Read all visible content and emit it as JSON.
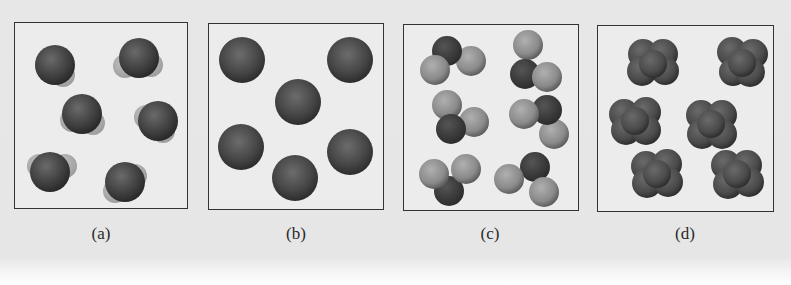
{
  "figure": {
    "panels": [
      {
        "id": "a",
        "label": "(a)",
        "description": "Six bent triatomic molecules (central atom with two faint small atoms)",
        "molecules": 6
      },
      {
        "id": "b",
        "label": "(b)",
        "description": "Six single atoms (monatomic)",
        "molecules": 6
      },
      {
        "id": "c",
        "label": "(c)",
        "description": "Six molecules of three atoms each: one dark atom and two light atoms",
        "molecules": 6
      },
      {
        "id": "d",
        "label": "(d)",
        "description": "Six clustered tetra-lobed molecules of identical dark atoms",
        "molecules": 6
      }
    ],
    "colors": {
      "background": "#e6e6e6",
      "panel_fill": "#ececec",
      "border": "#333333",
      "dark_atom": "#3a3a3a",
      "mid_atom": "#5a5a5a",
      "light_atom": "#8e8e8e",
      "faint_atom": "#a9a9a9"
    }
  }
}
